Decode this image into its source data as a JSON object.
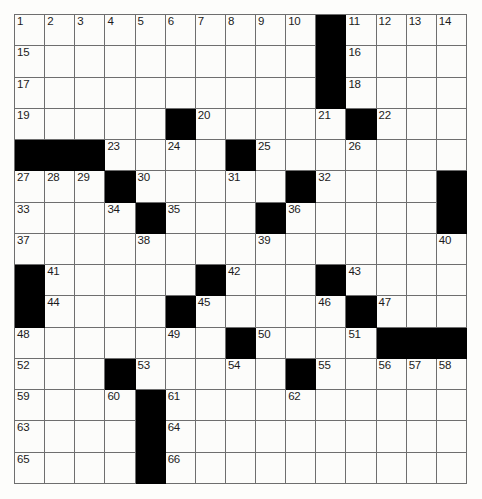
{
  "puzzle": {
    "title": "Crossword Puzzle Grid",
    "rows": 15,
    "cols": 15,
    "cell_background": "#fcfcfa",
    "block_color": "#000000",
    "grid_line_color": "#6e6e6e",
    "number_color": "#1b1b1b",
    "page_background": "#ffffff",
    "highest_clue_number": 66,
    "grid": [
      [
        {
          "n": "1"
        },
        {
          "n": "2"
        },
        {
          "n": "3"
        },
        {
          "n": "4"
        },
        {
          "n": "5"
        },
        {
          "n": "6"
        },
        {
          "n": "7"
        },
        {
          "n": "8"
        },
        {
          "n": "9"
        },
        {
          "n": "10"
        },
        {
          "b": true
        },
        {
          "n": "11"
        },
        {
          "n": "12"
        },
        {
          "n": "13"
        },
        {
          "n": "14"
        }
      ],
      [
        {
          "n": "15"
        },
        {},
        {},
        {},
        {},
        {},
        {},
        {},
        {},
        {},
        {
          "b": true
        },
        {
          "n": "16"
        },
        {},
        {},
        {}
      ],
      [
        {
          "n": "17"
        },
        {},
        {},
        {},
        {},
        {},
        {},
        {},
        {},
        {},
        {
          "b": true
        },
        {
          "n": "18"
        },
        {},
        {},
        {}
      ],
      [
        {
          "n": "19"
        },
        {},
        {},
        {},
        {},
        {
          "b": true
        },
        {
          "n": "20"
        },
        {},
        {},
        {},
        {
          "n": "21"
        },
        {
          "b": true
        },
        {
          "n": "22"
        },
        {},
        {}
      ],
      [
        {
          "b": true
        },
        {
          "b": true
        },
        {
          "b": true
        },
        {
          "n": "23"
        },
        {},
        {
          "n": "24"
        },
        {},
        {
          "b": true
        },
        {
          "n": "25"
        },
        {},
        {},
        {
          "n": "26"
        },
        {},
        {},
        {}
      ],
      [
        {
          "n": "27"
        },
        {
          "n": "28"
        },
        {
          "n": "29"
        },
        {
          "b": true
        },
        {
          "n": "30"
        },
        {},
        {},
        {
          "n": "31"
        },
        {},
        {
          "b": true
        },
        {
          "n": "32"
        },
        {},
        {},
        {},
        {
          "b": true
        }
      ],
      [
        {
          "n": "33"
        },
        {},
        {},
        {
          "n": "34"
        },
        {
          "b": true
        },
        {
          "n": "35"
        },
        {},
        {},
        {
          "b": true
        },
        {
          "n": "36"
        },
        {},
        {},
        {},
        {},
        {
          "b": true
        }
      ],
      [
        {
          "n": "37"
        },
        {},
        {},
        {},
        {
          "n": "38"
        },
        {},
        {},
        {},
        {
          "n": "39"
        },
        {},
        {},
        {},
        {},
        {},
        {
          "n": "40"
        }
      ],
      [
        {
          "b": true
        },
        {
          "n": "41"
        },
        {},
        {},
        {},
        {},
        {
          "b": true
        },
        {
          "n": "42"
        },
        {},
        {},
        {
          "b": true
        },
        {
          "n": "43"
        },
        {},
        {},
        {}
      ],
      [
        {
          "b": true
        },
        {
          "n": "44"
        },
        {},
        {},
        {},
        {
          "b": true
        },
        {
          "n": "45"
        },
        {},
        {},
        {},
        {
          "n": "46"
        },
        {
          "b": true
        },
        {
          "n": "47"
        },
        {},
        {}
      ],
      [
        {
          "n": "48"
        },
        {},
        {},
        {},
        {},
        {
          "n": "49"
        },
        {},
        {
          "b": true
        },
        {
          "n": "50"
        },
        {},
        {},
        {
          "n": "51"
        },
        {
          "b": true
        },
        {
          "b": true
        },
        {
          "b": true
        }
      ],
      [
        {
          "n": "52"
        },
        {},
        {},
        {
          "b": true
        },
        {
          "n": "53"
        },
        {},
        {},
        {
          "n": "54"
        },
        {},
        {
          "b": true
        },
        {
          "n": "55"
        },
        {},
        {
          "n": "56"
        },
        {
          "n": "57"
        },
        {
          "n": "58"
        }
      ],
      [
        {
          "n": "59"
        },
        {},
        {},
        {
          "n": "60"
        },
        {
          "b": true
        },
        {
          "n": "61"
        },
        {},
        {},
        {},
        {
          "n": "62"
        },
        {},
        {},
        {},
        {},
        {}
      ],
      [
        {
          "n": "63"
        },
        {},
        {},
        {},
        {
          "b": true
        },
        {
          "n": "64"
        },
        {},
        {},
        {},
        {},
        {},
        {},
        {},
        {},
        {}
      ],
      [
        {
          "n": "65"
        },
        {},
        {},
        {},
        {
          "b": true
        },
        {
          "n": "66"
        },
        {},
        {},
        {},
        {},
        {},
        {},
        {},
        {},
        {}
      ]
    ]
  }
}
